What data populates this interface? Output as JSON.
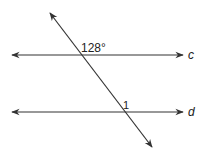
{
  "diagram": {
    "type": "parallel-lines-transversal",
    "lines": [
      {
        "name": "c",
        "label": "c",
        "y": 55,
        "x1": 12,
        "x2": 183
      },
      {
        "name": "d",
        "label": "d",
        "y": 112,
        "x1": 12,
        "x2": 183
      }
    ],
    "transversal": {
      "x1": 50,
      "y1": 13,
      "x2": 152,
      "y2": 147
    },
    "angles": [
      {
        "label": "128°",
        "at_line": "c"
      },
      {
        "label": "1",
        "at_line": "d"
      }
    ],
    "colors": {
      "stroke": "#333333",
      "text": "#222222"
    }
  }
}
